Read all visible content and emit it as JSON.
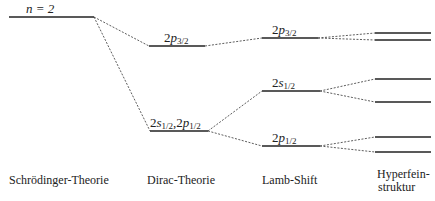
{
  "top_label": "n = 2",
  "states": {
    "dirac_upper": {
      "num": "2",
      "letter": "p",
      "sub": "3/2"
    },
    "dirac_lower": {
      "text": "2s1/2,2p1/2",
      "a_num": "2",
      "a_letter": "s",
      "a_sub": "1/2",
      "sep": ",",
      "b_num": "2",
      "b_letter": "p",
      "b_sub": "1/2"
    },
    "lamb_p32": {
      "num": "2",
      "letter": "p",
      "sub": "3/2"
    },
    "lamb_s12": {
      "num": "2",
      "letter": "s",
      "sub": "1/2"
    },
    "lamb_p12": {
      "num": "2",
      "letter": "p",
      "sub": "1/2"
    }
  },
  "columns": [
    {
      "label": "Schrödinger-Theorie"
    },
    {
      "label": "Dirac-Theorie"
    },
    {
      "label": "Lamb-Shift"
    },
    {
      "label_line1": "Hyperfein-",
      "label_line2": "struktur"
    }
  ],
  "levels": {
    "schroedinger": [
      {
        "x1": 9,
        "x2": 94,
        "y": 17
      }
    ],
    "dirac": [
      {
        "x1": 149,
        "x2": 205,
        "y": 46
      },
      {
        "x1": 150,
        "x2": 208,
        "y": 131
      }
    ],
    "lamb": [
      {
        "x1": 262,
        "x2": 318,
        "y": 38
      },
      {
        "x1": 262,
        "x2": 320,
        "y": 91
      },
      {
        "x1": 262,
        "x2": 320,
        "y": 146
      }
    ],
    "hyperfine": [
      {
        "x1": 375,
        "x2": 431,
        "y": 33
      },
      {
        "x1": 375,
        "x2": 431,
        "y": 40
      },
      {
        "x1": 375,
        "x2": 431,
        "y": 79
      },
      {
        "x1": 375,
        "x2": 431,
        "y": 102
      },
      {
        "x1": 375,
        "x2": 431,
        "y": 137
      },
      {
        "x1": 375,
        "x2": 431,
        "y": 152
      }
    ]
  }
}
